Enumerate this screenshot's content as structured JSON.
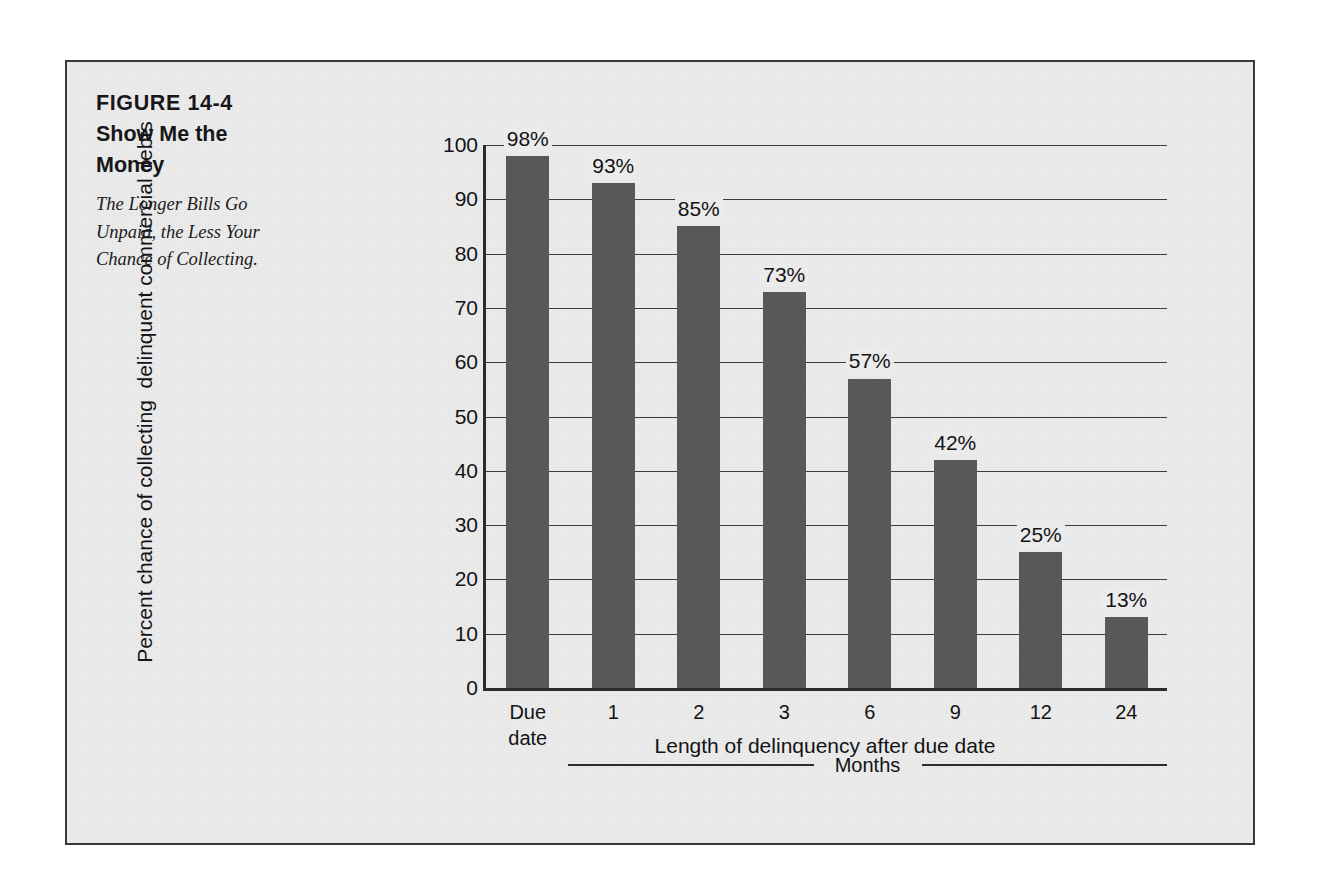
{
  "figure": {
    "number": "FIGURE 14-4",
    "title": "Show Me the Money",
    "subtitle": "The Longer Bills Go Unpaid, the Less Your Chance of Collecting."
  },
  "colors": {
    "bar": "#58585b",
    "panel_background": "#ebebeb",
    "frame_border": "#3a3a3a",
    "text": "#131316",
    "gridline": "#3c3c3f"
  },
  "axis": {
    "months_bracket_label": "Months"
  },
  "chart_data": {
    "type": "bar",
    "title": "Show Me the Money",
    "subtitle": "The Longer Bills Go Unpaid, the Less Your Chance of Collecting.",
    "categories": [
      "Due\ndate",
      "1",
      "2",
      "3",
      "6",
      "9",
      "12",
      "24"
    ],
    "category_labels_plain": [
      "Due date",
      "1",
      "2",
      "3",
      "6",
      "9",
      "12",
      "24"
    ],
    "values": [
      98,
      93,
      85,
      73,
      57,
      42,
      25,
      13
    ],
    "data_labels": [
      "98%",
      "93%",
      "85%",
      "73%",
      "57%",
      "42%",
      "25%",
      "13%"
    ],
    "xlabel": "Length of delinquency after due date",
    "ylabel": "Percent chance of collecting  delinquent commercial debts",
    "ylim": [
      0,
      100
    ],
    "yticks": [
      0,
      10,
      20,
      30,
      40,
      50,
      60,
      70,
      80,
      90,
      100
    ],
    "ytick_labels": [
      "0",
      "10",
      "20",
      "30",
      "40",
      "50",
      "60",
      "70",
      "80",
      "90",
      "100"
    ],
    "grid": true,
    "legend": null,
    "annotations": [
      "Months"
    ]
  }
}
